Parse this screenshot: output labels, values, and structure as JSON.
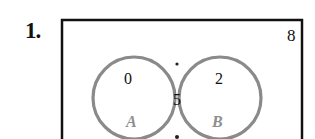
{
  "problem": {
    "number": "1."
  },
  "venn": {
    "universe_count": "8",
    "only_a": "0",
    "intersection": "5",
    "only_b": "2",
    "set_a_label": "A",
    "set_b_label": "B",
    "colors": {
      "frame": "#111111",
      "circle": "#8a8a8a",
      "set_label": "#8f8f8f",
      "text": "#111111"
    }
  }
}
